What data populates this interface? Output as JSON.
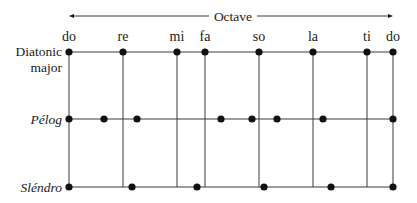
{
  "octave": {
    "label": "Octave",
    "x_start": 69,
    "x_end": 393,
    "y": 16
  },
  "scale_top_labels": [
    {
      "label": "do",
      "x": 69
    },
    {
      "label": "re",
      "x": 123
    },
    {
      "label": "mi",
      "x": 177
    },
    {
      "label": "fa",
      "x": 205
    },
    {
      "label": "so",
      "x": 259
    },
    {
      "label": "la",
      "x": 313
    },
    {
      "label": "ti",
      "x": 367
    },
    {
      "label": "do",
      "x": 393
    }
  ],
  "rows": [
    {
      "name": "Diatonic major",
      "label_lines": [
        "Diatonic",
        "major"
      ],
      "italic": false,
      "y": 52,
      "dots_x": [
        69,
        123,
        177,
        205,
        259,
        313,
        367,
        393
      ]
    },
    {
      "name": "Pélog",
      "label_lines": [
        "Pélog"
      ],
      "italic": true,
      "y": 119,
      "dots_x": [
        69,
        104,
        137,
        221,
        252,
        277,
        323,
        393
      ]
    },
    {
      "name": "Sléndro",
      "label_lines": [
        "Sléndro"
      ],
      "italic": true,
      "y": 187,
      "dots_x": [
        69,
        132,
        197,
        264,
        331,
        393
      ]
    }
  ],
  "vertical_lines_x": [
    69,
    123,
    177,
    205,
    259,
    313,
    367,
    393
  ],
  "colors": {
    "line": "#3a3a3a",
    "dot": "#111111",
    "text": "#1a1a1a",
    "background": "#ffffff"
  }
}
